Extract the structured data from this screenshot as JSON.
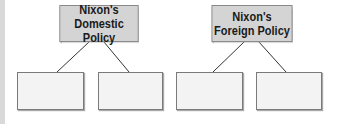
{
  "diagram": {
    "groups": [
      {
        "title_line1": "Nixon's",
        "title_line2": "Domestic Policy",
        "children": [
          {
            "label": ""
          },
          {
            "label": ""
          }
        ]
      },
      {
        "title_line1": "Nixon's",
        "title_line2": "Foreign Policy",
        "children": [
          {
            "label": ""
          },
          {
            "label": ""
          }
        ]
      }
    ]
  },
  "colors": {
    "header_fill": "#d4d4d4",
    "child_fill": "#f3f3f3",
    "border": "#7a7a7a",
    "connector": "#333333"
  }
}
